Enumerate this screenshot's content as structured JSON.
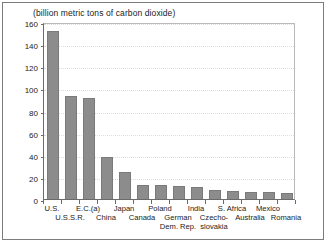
{
  "chart_data": {
    "type": "bar",
    "title": "(billion metric tons of carbon dioxide)",
    "xlabel": "",
    "ylabel": "",
    "ylim": [
      0,
      160
    ],
    "ytick_values": [
      0,
      20,
      40,
      60,
      80,
      100,
      120,
      140,
      160
    ],
    "ytick_labels": [
      "0",
      "20",
      "40",
      "60",
      "80",
      "100",
      "120",
      "140",
      "160"
    ],
    "grid": true,
    "legend": "none",
    "bar_color": "#8c8c8c",
    "categories": [
      "U.S.",
      "U.S.S.R.",
      "E.C.(a)",
      "China",
      "Japan",
      "Canada",
      "Poland",
      "German Dem. Rep.",
      "India",
      "Czecho-slovakia",
      "S. Africa",
      "Australia",
      "Mexico",
      "Romania"
    ],
    "values": [
      152,
      93,
      91,
      38,
      24,
      13,
      13,
      12,
      11,
      8,
      7.5,
      6.5,
      6.5,
      5.5
    ],
    "label_lines": [
      [
        "U.S.",
        ""
      ],
      [
        "U.S.S.R.",
        ""
      ],
      [
        "E.C.(a)",
        ""
      ],
      [
        "China",
        ""
      ],
      [
        "Japan",
        ""
      ],
      [
        "Canada",
        ""
      ],
      [
        "Poland",
        ""
      ],
      [
        "German",
        "Dem. Rep."
      ],
      [
        "India",
        ""
      ],
      [
        "Czecho-",
        "slovakia"
      ],
      [
        "S. Africa",
        ""
      ],
      [
        "Australia",
        ""
      ],
      [
        "Mexico",
        ""
      ],
      [
        "Romania",
        ""
      ]
    ],
    "label_rows": [
      0,
      1,
      0,
      1,
      0,
      1,
      0,
      1,
      0,
      1,
      0,
      1,
      0,
      1
    ]
  }
}
